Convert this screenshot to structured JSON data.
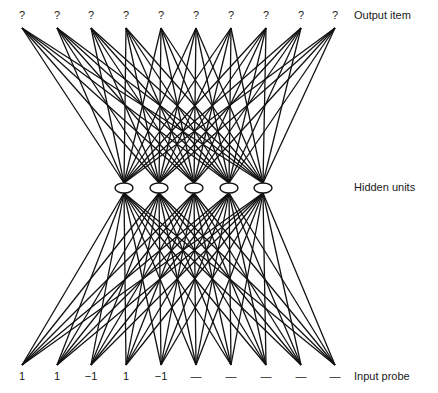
{
  "diagram": {
    "type": "neural-network",
    "layers": [
      {
        "name": "output",
        "label": "Output item",
        "values": [
          "?",
          "?",
          "?",
          "?",
          "?",
          "?",
          "?",
          "?",
          "?",
          "?"
        ]
      },
      {
        "name": "hidden",
        "label": "Hidden units",
        "count": 5
      },
      {
        "name": "input",
        "label": "Input probe",
        "values": [
          "1",
          "1",
          "−1",
          "1",
          "−1",
          "—",
          "—",
          "—",
          "—",
          "—"
        ]
      }
    ],
    "connections": "fully-connected between adjacent layers",
    "line_color": "#111111",
    "node_fill": "#ffffff"
  }
}
